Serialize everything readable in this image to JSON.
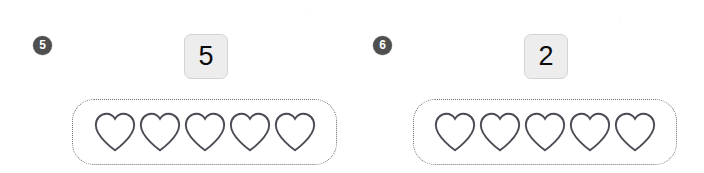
{
  "page": {
    "background_color": "#ffffff",
    "type": "counting-worksheet"
  },
  "style": {
    "badge_fill": "#4f4f4f",
    "badge_text_color": "#ffffff",
    "answer_box_fill": "#ededed",
    "answer_box_border": "#d2d2d2",
    "group_border_color": "#6e6e6e",
    "shape_stroke_color": "#4b4b55"
  },
  "exercises": [
    {
      "number": "5",
      "answer": "5",
      "shape": "heart-icon",
      "shape_count": 5,
      "shapes": [
        "heart",
        "heart",
        "heart",
        "heart",
        "heart"
      ]
    },
    {
      "number": "6",
      "answer": "2",
      "shape": "heart-icon",
      "shape_count": 5,
      "shapes": [
        "heart",
        "heart",
        "heart",
        "heart",
        "heart"
      ]
    }
  ]
}
